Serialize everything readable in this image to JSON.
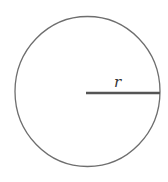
{
  "diagram": {
    "shape": "circle",
    "radius_label": "r",
    "colors": {
      "stroke": "#6e6e6e",
      "radius_line": "#555555",
      "label": "#333333",
      "background": "#ffffff"
    }
  }
}
